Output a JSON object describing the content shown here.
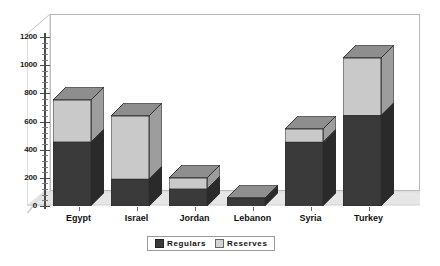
{
  "chart_data": {
    "type": "bar",
    "subtype": "stacked-3d-column",
    "title": "",
    "xlabel": "",
    "ylabel": "",
    "ylim": [
      0,
      1200
    ],
    "y_ticks": [
      0,
      200,
      400,
      600,
      800,
      1000,
      1200
    ],
    "y_tick_labels": [
      "0",
      "200",
      "400",
      "600",
      "800",
      "1000",
      "1200"
    ],
    "minor_ticks_per_interval": 4,
    "grid": false,
    "legend_position": "bottom-center",
    "categories": [
      "Egypt",
      "Israel",
      "Jordan",
      "Lebanon",
      "Syria",
      "Turkey"
    ],
    "series": [
      {
        "name": "Regulars",
        "color": "#3a3a3a",
        "values": [
          450,
          190,
          120,
          50,
          450,
          640
        ]
      },
      {
        "name": "Reserves",
        "color": "#c9c9c9",
        "values": [
          300,
          450,
          80,
          5,
          95,
          410
        ]
      }
    ],
    "totals": [
      750,
      640,
      200,
      55,
      545,
      1050
    ]
  },
  "axis": {
    "y_labels": [
      "1200",
      "1000",
      "800",
      "600",
      "400",
      "200",
      "0"
    ]
  },
  "legend": {
    "items": [
      {
        "label": "Regulars",
        "swatch": "dark-square-icon"
      },
      {
        "label": "Reserves",
        "swatch": "light-square-icon"
      }
    ]
  },
  "colors": {
    "regulars": "#3a3a3a",
    "reserves": "#c9c9c9",
    "regulars_side": "#2a2a2a",
    "reserves_side": "#9d9d9d",
    "top_face": "#8e8e8e",
    "floor": "#dcdcdc",
    "frame": "#b9b9b9",
    "axis": "#4a4a4a",
    "text": "#101010"
  }
}
